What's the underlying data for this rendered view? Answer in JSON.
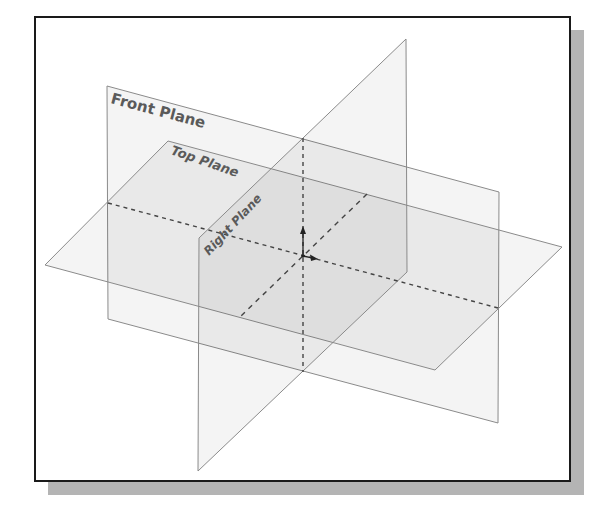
{
  "figure": {
    "frame": {
      "x": 35,
      "y": 17,
      "width": 535,
      "height": 464,
      "border_color": "#1a1a1a",
      "border_width": 2
    },
    "shadow": {
      "offset_x": 13,
      "offset_y": 13,
      "color": "#b4b4b4"
    },
    "planes": [
      {
        "id": "front",
        "label": "Front Plane",
        "points": "107,86 499,192 498,423 108,319",
        "fill": "rgba(0,0,0,0.045)",
        "stroke": "#8a8a8a"
      },
      {
        "id": "top",
        "label": "Top Plane",
        "points": "168,141 562,247 435,370 45,265",
        "fill": "rgba(0,0,0,0.045)",
        "stroke": "#8a8a8a"
      },
      {
        "id": "right",
        "label": "Right Plane",
        "points": "406,39 407,272 198,471 199,238",
        "fill": "rgba(0,0,0,0.045)",
        "stroke": "#8a8a8a"
      }
    ],
    "labels": {
      "front": {
        "text": "Front Plane",
        "x": 110,
        "y": 103,
        "angle": 15,
        "size": 15
      },
      "top": {
        "text": "Top Plane",
        "x": 170,
        "y": 154,
        "angle": 19,
        "size": 13
      },
      "right": {
        "text": "Right Plane",
        "x": 209,
        "y": 256,
        "angle": -47,
        "size": 12
      }
    },
    "intersection_lines": [
      {
        "name": "front-top-intersection",
        "x1": 108,
        "y1": 203,
        "x2": 498,
        "y2": 308
      },
      {
        "name": "front-right-intersection",
        "x1": 303,
        "y1": 138,
        "x2": 303,
        "y2": 372
      },
      {
        "name": "top-right-intersection",
        "x1": 367,
        "y1": 194,
        "x2": 240,
        "y2": 317
      }
    ],
    "origin": {
      "x": 303,
      "y": 256,
      "y_axis_tip": {
        "x": 303,
        "y": 226
      },
      "x_axis_tip": {
        "x": 318,
        "y": 259
      },
      "color": "#222222"
    },
    "colors": {
      "edge": "#8a8a8a",
      "dashed": "#444444",
      "label": "#5a5a5a"
    }
  }
}
